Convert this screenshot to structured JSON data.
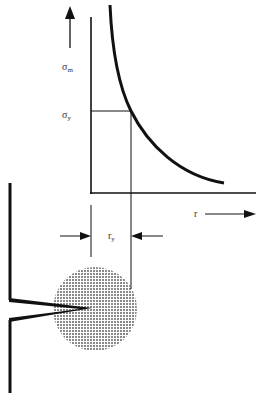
{
  "diagram": {
    "type": "plastic-zone-at-crack-tip",
    "colors": {
      "line": "#111111",
      "text": "#333333",
      "zone_fill": "#9a9a9a",
      "background": "#ffffff"
    },
    "labels": {
      "sigma_m": "σ",
      "sigma_m_sub": "m",
      "sigma_y": "σ",
      "sigma_y_sub": "y",
      "r_axis": "r",
      "r_y": "r",
      "r_y_sub": "y"
    },
    "elements": [
      "stress-axis-arrow",
      "y-axis",
      "x-axis",
      "stress-decay-curve",
      "yield-stress-line",
      "plastic-zone-boundary-line",
      "r-direction-arrow",
      "ry-dimension-arrows",
      "crack-edge",
      "crack-notch",
      "plastic-zone-circle"
    ]
  }
}
